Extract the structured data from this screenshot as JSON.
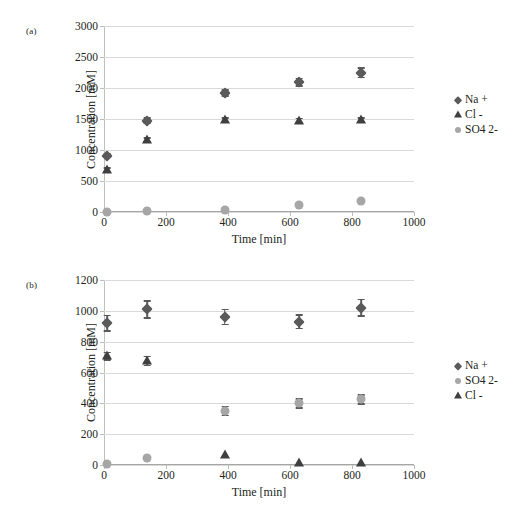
{
  "figure": {
    "caption_cut": "",
    "panels": [
      "(a)",
      "(b)"
    ]
  },
  "chart_data": [
    {
      "type": "scatter",
      "panel": "(a)",
      "title": "",
      "xlabel": "Time [min]",
      "ylabel": "Concentration [mM]",
      "xlim": [
        0,
        1000
      ],
      "ylim": [
        0,
        3000
      ],
      "xticks": [
        0,
        200,
        400,
        600,
        800,
        1000
      ],
      "yticks": [
        0,
        500,
        1000,
        1500,
        2000,
        2500,
        3000
      ],
      "grid": "horizontal",
      "legend_position": "right",
      "x": [
        10,
        140,
        390,
        630,
        830
      ],
      "series": [
        {
          "name": "Na +",
          "marker": "diamond",
          "color": "#5a5a5a",
          "values": [
            905,
            1475,
            1920,
            2090,
            2245
          ],
          "errors": [
            40,
            55,
            60,
            75,
            90
          ]
        },
        {
          "name": "Cl -",
          "marker": "triangle",
          "color": "#3f3f3f",
          "values": [
            680,
            1165,
            1480,
            1475,
            1480
          ],
          "errors": [
            45,
            45,
            50,
            45,
            45
          ]
        },
        {
          "name": "SO4 2-",
          "marker": "circle",
          "color": "#a6a6a6",
          "values": [
            5,
            15,
            40,
            105,
            175
          ],
          "errors": [
            0,
            0,
            0,
            0,
            0
          ]
        }
      ]
    },
    {
      "type": "scatter",
      "panel": "(b)",
      "title": "",
      "xlabel": "Time [min]",
      "ylabel": "Concentration [mM]",
      "xlim": [
        0,
        1000
      ],
      "ylim": [
        0,
        1200
      ],
      "xticks": [
        0,
        200,
        400,
        600,
        800,
        1000
      ],
      "yticks": [
        0,
        200,
        400,
        600,
        800,
        1000,
        1200
      ],
      "grid": "horizontal",
      "legend_position": "right",
      "x": [
        10,
        140,
        390,
        630,
        830
      ],
      "series": [
        {
          "name": "Na +",
          "marker": "diamond",
          "color": "#5a5a5a",
          "values": [
            920,
            1010,
            960,
            930,
            1020
          ],
          "errors": [
            55,
            60,
            55,
            50,
            60
          ]
        },
        {
          "name": "SO4 2-",
          "marker": "circle",
          "color": "#a6a6a6",
          "values": [
            5,
            45,
            350,
            400,
            425
          ],
          "errors": [
            0,
            0,
            35,
            35,
            35
          ]
        },
        {
          "name": "Cl -",
          "marker": "triangle",
          "color": "#3f3f3f",
          "values": [
            705,
            675,
            65,
            10,
            10
          ],
          "errors": [
            30,
            35,
            0,
            0,
            0
          ]
        }
      ]
    }
  ],
  "panel_a": {
    "label": "(a)",
    "ylabel": "Concentration [mM]",
    "xlabel": "Time [min]",
    "yticks": [
      "0",
      "500",
      "1000",
      "1500",
      "2000",
      "2500",
      "3000"
    ],
    "xticks": [
      "0",
      "200",
      "400",
      "600",
      "800",
      "1000"
    ],
    "legend": [
      "Na +",
      "Cl -",
      "SO4 2-"
    ]
  },
  "panel_b": {
    "label": "(b)",
    "ylabel": "Concentration [mM]",
    "xlabel": "Time [min]",
    "yticks": [
      "0",
      "200",
      "400",
      "600",
      "800",
      "1000",
      "1200"
    ],
    "xticks": [
      "0",
      "200",
      "400",
      "600",
      "800",
      "1000"
    ],
    "legend": [
      "Na +",
      "SO4 2-",
      "Cl -"
    ]
  }
}
